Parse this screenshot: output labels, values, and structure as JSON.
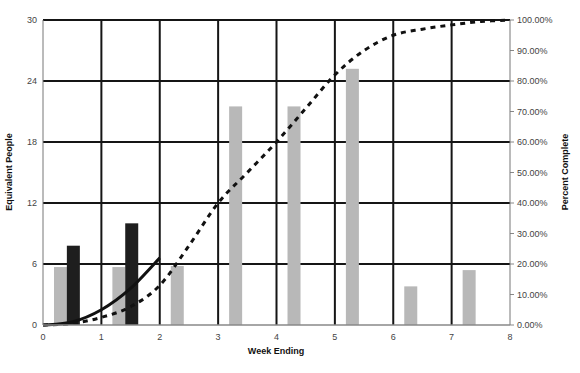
{
  "chart_data": {
    "type": "bar",
    "title": "",
    "xlabel": "Week Ending",
    "ylabel": "Equivalent People",
    "y2label": "Percent Complete",
    "xlim": [
      0,
      8
    ],
    "ylim": [
      0,
      30
    ],
    "y2lim": [
      0,
      1
    ],
    "x_ticks": [
      "0",
      "1",
      "2",
      "3",
      "4",
      "5",
      "6",
      "7",
      "8"
    ],
    "y_ticks": [
      "0",
      "6",
      "12",
      "18",
      "24",
      "30"
    ],
    "y2_ticks": [
      "0.00%",
      "10.00%",
      "20.00%",
      "30.00%",
      "40.00%",
      "50.00%",
      "60.00%",
      "70.00%",
      "80.00%",
      "90.00%",
      "100.00%"
    ],
    "grid": true,
    "legend": null,
    "series": [
      {
        "name": "Planned Staffing",
        "kind": "bar",
        "axis": "left",
        "color": "#b8b8b8",
        "points": [
          {
            "x": 0.3,
            "y": 5.7
          },
          {
            "x": 1.3,
            "y": 5.7
          },
          {
            "x": 2.3,
            "y": 5.8
          },
          {
            "x": 3.3,
            "y": 21.5
          },
          {
            "x": 4.3,
            "y": 21.5
          },
          {
            "x": 5.3,
            "y": 25.2
          },
          {
            "x": 6.3,
            "y": 3.8
          },
          {
            "x": 7.3,
            "y": 5.4
          }
        ]
      },
      {
        "name": "Actual Staffing",
        "kind": "bar",
        "axis": "left",
        "color": "#1e1e1e",
        "points": [
          {
            "x": 0.52,
            "y": 7.8
          },
          {
            "x": 1.52,
            "y": 10.0
          }
        ]
      },
      {
        "name": "Actual Percent Complete",
        "kind": "line",
        "style": "solid",
        "axis": "right",
        "color": "#111111",
        "points": [
          {
            "x": 0.0,
            "y": 0.0
          },
          {
            "x": 0.5,
            "y": 0.01
          },
          {
            "x": 1.0,
            "y": 0.05
          },
          {
            "x": 1.5,
            "y": 0.12
          },
          {
            "x": 2.0,
            "y": 0.22
          }
        ]
      },
      {
        "name": "Planned Percent Complete",
        "kind": "line",
        "style": "dashed",
        "axis": "right",
        "color": "#111111",
        "points": [
          {
            "x": 0.0,
            "y": 0.0
          },
          {
            "x": 0.5,
            "y": 0.005
          },
          {
            "x": 1.0,
            "y": 0.025
          },
          {
            "x": 1.5,
            "y": 0.06
          },
          {
            "x": 2.0,
            "y": 0.13
          },
          {
            "x": 2.5,
            "y": 0.26
          },
          {
            "x": 3.0,
            "y": 0.4
          },
          {
            "x": 3.5,
            "y": 0.5
          },
          {
            "x": 4.0,
            "y": 0.6
          },
          {
            "x": 4.5,
            "y": 0.71
          },
          {
            "x": 5.0,
            "y": 0.82
          },
          {
            "x": 5.5,
            "y": 0.9
          },
          {
            "x": 6.0,
            "y": 0.95
          },
          {
            "x": 6.5,
            "y": 0.97
          },
          {
            "x": 7.0,
            "y": 0.984
          },
          {
            "x": 7.5,
            "y": 0.995
          },
          {
            "x": 8.0,
            "y": 1.0
          }
        ]
      }
    ]
  }
}
